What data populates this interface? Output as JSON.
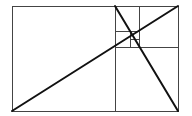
{
  "diagram": {
    "width": 192,
    "height": 116,
    "colors": {
      "background": "#ffffff",
      "thin_line": "#444444",
      "thick_line": "#111111"
    },
    "outer_rect": {
      "x": 12,
      "y": 6,
      "w": 166,
      "h": 105
    },
    "dividers": [
      {
        "x1": 115,
        "y1": 6,
        "x2": 115,
        "y2": 111
      },
      {
        "x1": 115,
        "y1": 47,
        "x2": 178,
        "y2": 47
      },
      {
        "x1": 139,
        "y1": 6,
        "x2": 139,
        "y2": 47
      },
      {
        "x1": 115,
        "y1": 31,
        "x2": 139,
        "y2": 31
      },
      {
        "x1": 130,
        "y1": 31,
        "x2": 130,
        "y2": 47
      },
      {
        "x1": 130,
        "y1": 39,
        "x2": 139,
        "y2": 39
      }
    ],
    "diagonals": [
      {
        "x1": 12,
        "y1": 111,
        "x2": 178,
        "y2": 6
      },
      {
        "x1": 115,
        "y1": 6,
        "x2": 178,
        "y2": 111
      }
    ]
  }
}
